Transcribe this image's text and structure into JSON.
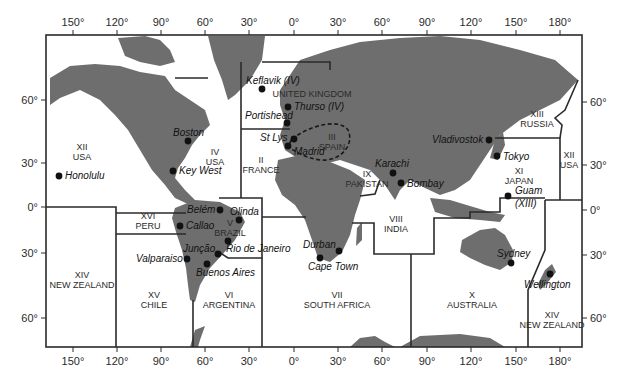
{
  "map": {
    "top_ticks": [
      {
        "label": "150°",
        "x": 73
      },
      {
        "label": "120°",
        "x": 117
      },
      {
        "label": "90°",
        "x": 161
      },
      {
        "label": "60°",
        "x": 205
      },
      {
        "label": "30°",
        "x": 249
      },
      {
        "label": "0°",
        "x": 294
      },
      {
        "label": "30°",
        "x": 338
      },
      {
        "label": "60°",
        "x": 382
      },
      {
        "label": "90°",
        "x": 427
      },
      {
        "label": "120°",
        "x": 471
      },
      {
        "label": "150°",
        "x": 516
      },
      {
        "label": "180°",
        "x": 560
      }
    ],
    "bottom_ticks": [
      {
        "label": "150°",
        "x": 73
      },
      {
        "label": "120°",
        "x": 117
      },
      {
        "label": "90°",
        "x": 161
      },
      {
        "label": "60°",
        "x": 205
      },
      {
        "label": "30°",
        "x": 249
      },
      {
        "label": "0°",
        "x": 294
      },
      {
        "label": "30°",
        "x": 338
      },
      {
        "label": "60°",
        "x": 382
      },
      {
        "label": "90°",
        "x": 427
      },
      {
        "label": "120°",
        "x": 471
      },
      {
        "label": "150°",
        "x": 516
      },
      {
        "label": "180°",
        "x": 560
      }
    ],
    "left_ticks": [
      {
        "label": "60°",
        "y": 100
      },
      {
        "label": "30°",
        "y": 163
      },
      {
        "label": "0°",
        "y": 207
      },
      {
        "label": "30°",
        "y": 253
      },
      {
        "label": "60°",
        "y": 318
      }
    ],
    "right_ticks": [
      {
        "label": "60°",
        "y": 102
      },
      {
        "label": "30°",
        "y": 165
      },
      {
        "label": "0°",
        "y": 210
      },
      {
        "label": "30°",
        "y": 255
      },
      {
        "label": "60°",
        "y": 318
      }
    ],
    "areas": [
      {
        "num": "XII",
        "name": "USA",
        "x": 82,
        "y": 150
      },
      {
        "num": "IV",
        "name": "USA",
        "x": 215,
        "y": 155
      },
      {
        "num": "II",
        "name": "FRANCE",
        "x": 261,
        "y": 163
      },
      {
        "num": "",
        "name": "UNITED KINGDOM",
        "x": 312,
        "y": 97
      },
      {
        "num": "III",
        "name": "SPAIN",
        "x": 332,
        "y": 140
      },
      {
        "num": "IX",
        "name": "PAKISTAN",
        "x": 367,
        "y": 177
      },
      {
        "num": "VIII",
        "name": "INDIA",
        "x": 396,
        "y": 222
      },
      {
        "num": "XIII",
        "name": "RUSSIA",
        "x": 537,
        "y": 117
      },
      {
        "num": "XI",
        "name": "JAPAN",
        "x": 519,
        "y": 174
      },
      {
        "num": "XII",
        "name": "USA",
        "x": 569,
        "y": 158
      },
      {
        "num": "XVI",
        "name": "PERU",
        "x": 148,
        "y": 219
      },
      {
        "num": "V",
        "name": "BRAZIL",
        "x": 230,
        "y": 226
      },
      {
        "num": "XIV",
        "name": "NEW ZEALAND",
        "x": 82,
        "y": 278
      },
      {
        "num": "XV",
        "name": "CHILE",
        "x": 154,
        "y": 298
      },
      {
        "num": "VI",
        "name": "ARGENTINA",
        "x": 229,
        "y": 298
      },
      {
        "num": "VII",
        "name": "SOUTH AFRICA",
        "x": 337,
        "y": 298
      },
      {
        "num": "X",
        "name": "AUSTRALIA",
        "x": 472,
        "y": 298
      },
      {
        "num": "XIV",
        "name": "NEW ZEALAND",
        "x": 552,
        "y": 318
      }
    ],
    "stations": [
      {
        "name": "Honolulu",
        "dx": 59,
        "dy": 176,
        "tx": 65,
        "ty": 179
      },
      {
        "name": "Boston",
        "dx": 188,
        "dy": 141,
        "tx": 173,
        "ty": 136
      },
      {
        "name": "Key West",
        "dx": 173,
        "dy": 171,
        "tx": 179,
        "ty": 174
      },
      {
        "name": "Keflavik (IV)",
        "dx": 262,
        "dy": 89,
        "tx": 246,
        "ty": 84
      },
      {
        "name": "Thurso (IV)",
        "dx": 288,
        "dy": 107,
        "tx": 294,
        "ty": 110
      },
      {
        "name": "Portishead",
        "dx": 287,
        "dy": 123,
        "tx": 245,
        "ty": 119
      },
      {
        "name": "St Lys",
        "dx": 294,
        "dy": 139,
        "tx": 260,
        "ty": 141
      },
      {
        "name": "Madrid",
        "dx": 288,
        "dy": 146,
        "tx": 294,
        "ty": 155
      },
      {
        "name": "Karachi",
        "dx": 393,
        "dy": 173,
        "tx": 375,
        "ty": 167
      },
      {
        "name": "Bombay",
        "dx": 401,
        "dy": 183,
        "tx": 407,
        "ty": 187
      },
      {
        "name": "Vladivostok",
        "dx": 489,
        "dy": 140,
        "tx": 432,
        "ty": 143
      },
      {
        "name": "Tokyo",
        "dx": 497,
        "dy": 156,
        "tx": 503,
        "ty": 160
      },
      {
        "name": "Guam",
        "dx": 508,
        "dy": 196,
        "tx": 515,
        "ty": 194
      },
      {
        "name": "(XIII)",
        "dx": null,
        "dy": null,
        "tx": 515,
        "ty": 207
      },
      {
        "name": "Belém",
        "dx": 220,
        "dy": 210,
        "tx": 187,
        "ty": 213
      },
      {
        "name": "Olinda",
        "dx": 239,
        "dy": 220,
        "tx": 230,
        "ty": 215
      },
      {
        "name": "Callao",
        "dx": 180,
        "dy": 226,
        "tx": 186,
        "ty": 229
      },
      {
        "name": "Rio de Janeiro",
        "dx": 228,
        "dy": 241,
        "tx": 226,
        "ty": 252
      },
      {
        "name": "Junção",
        "dx": 218,
        "dy": 254,
        "tx": 183,
        "ty": 252
      },
      {
        "name": "Valparaiso",
        "dx": 187,
        "dy": 259,
        "tx": 136,
        "ty": 262
      },
      {
        "name": "Buenos Aires",
        "dx": 207,
        "dy": 264,
        "tx": 196,
        "ty": 276
      },
      {
        "name": "Durban",
        "dx": 339,
        "dy": 251,
        "tx": 303,
        "ty": 248
      },
      {
        "name": "Cape Town",
        "dx": 320,
        "dy": 258,
        "tx": 308,
        "ty": 270
      },
      {
        "name": "Sydney",
        "dx": 511,
        "dy": 263,
        "tx": 497,
        "ty": 257
      },
      {
        "name": "Wellington",
        "dx": 550,
        "dy": 274,
        "tx": 524,
        "ty": 288
      }
    ],
    "colors": {
      "land": "#6e6e6e",
      "line": "#2a2a2a",
      "background": "#ffffff"
    }
  }
}
